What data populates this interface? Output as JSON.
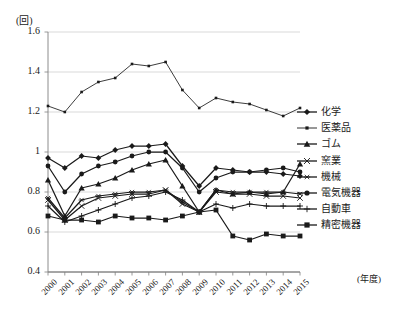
{
  "chart_data": {
    "type": "line",
    "title": "",
    "xlabel": "(年度)",
    "ylabel": "(回)",
    "x": [
      2000,
      2001,
      2002,
      2003,
      2004,
      2005,
      2006,
      2007,
      2008,
      2009,
      2010,
      2011,
      2012,
      2013,
      2014,
      2015
    ],
    "xtick_labels": [
      "2000",
      "2001",
      "2002",
      "2003",
      "2004",
      "2005",
      "2006",
      "2007",
      "2008",
      "2009",
      "2010",
      "2011",
      "2012",
      "2013",
      "2014",
      "2015"
    ],
    "ytick_labels": [
      "1.6",
      "1.4",
      "1.2",
      "1",
      "0.8",
      "0.6",
      "0.4"
    ],
    "ytick_values": [
      1.6,
      1.4,
      1.2,
      1.0,
      0.8,
      0.6,
      0.4
    ],
    "ylim": [
      0.4,
      1.6
    ],
    "grid": "horizontal",
    "legend_position": "right",
    "series": [
      {
        "name": "化学",
        "marker": "diamond",
        "values": [
          0.97,
          0.92,
          0.98,
          0.97,
          1.01,
          1.03,
          1.03,
          1.04,
          0.93,
          0.83,
          0.92,
          0.91,
          0.9,
          0.9,
          0.89,
          0.88
        ]
      },
      {
        "name": "医薬品",
        "marker": "square",
        "values": [
          1.23,
          1.2,
          1.3,
          1.35,
          1.37,
          1.44,
          1.43,
          1.45,
          1.31,
          1.22,
          1.27,
          1.25,
          1.24,
          1.21,
          1.18,
          1.22
        ]
      },
      {
        "name": "ゴム",
        "marker": "triangle",
        "values": [
          0.86,
          0.68,
          0.82,
          0.84,
          0.87,
          0.91,
          0.94,
          0.96,
          0.83,
          0.7,
          0.81,
          0.79,
          0.8,
          0.79,
          0.8,
          0.94
        ]
      },
      {
        "name": "窯業",
        "marker": "cross",
        "values": [
          0.76,
          0.66,
          0.73,
          0.77,
          0.78,
          0.79,
          0.79,
          0.81,
          0.74,
          0.7,
          0.8,
          0.79,
          0.79,
          0.78,
          0.78,
          0.77
        ]
      },
      {
        "name": "機械",
        "marker": "star",
        "values": [
          0.77,
          0.67,
          0.76,
          0.78,
          0.79,
          0.8,
          0.8,
          0.81,
          0.75,
          0.7,
          0.81,
          0.8,
          0.8,
          0.8,
          0.8,
          0.79
        ]
      },
      {
        "name": "電気機器",
        "marker": "circle",
        "values": [
          0.93,
          0.8,
          0.89,
          0.93,
          0.95,
          0.98,
          1.0,
          1.0,
          0.92,
          0.8,
          0.87,
          0.9,
          0.9,
          0.91,
          0.92,
          0.9
        ]
      },
      {
        "name": "自動車",
        "marker": "plus",
        "values": [
          0.73,
          0.65,
          0.68,
          0.71,
          0.74,
          0.77,
          0.78,
          0.8,
          0.76,
          0.7,
          0.74,
          0.72,
          0.74,
          0.73,
          0.73,
          0.73
        ]
      },
      {
        "name": "精密機器",
        "marker": "square",
        "values": [
          0.68,
          0.66,
          0.66,
          0.65,
          0.68,
          0.67,
          0.67,
          0.66,
          0.68,
          0.7,
          0.71,
          0.58,
          0.56,
          0.59,
          0.58,
          0.58
        ]
      }
    ]
  },
  "legend": {
    "items": [
      {
        "label": "化学"
      },
      {
        "label": "医薬品"
      },
      {
        "label": "ゴム"
      },
      {
        "label": "窯業"
      },
      {
        "label": "機械"
      },
      {
        "label": "電気機器"
      },
      {
        "label": "自動車"
      },
      {
        "label": "精密機器"
      }
    ]
  },
  "colors": {
    "line": "#1a1a1a",
    "grid": "#c8c8c8",
    "axis": "#808080",
    "background": "#ffffff"
  }
}
